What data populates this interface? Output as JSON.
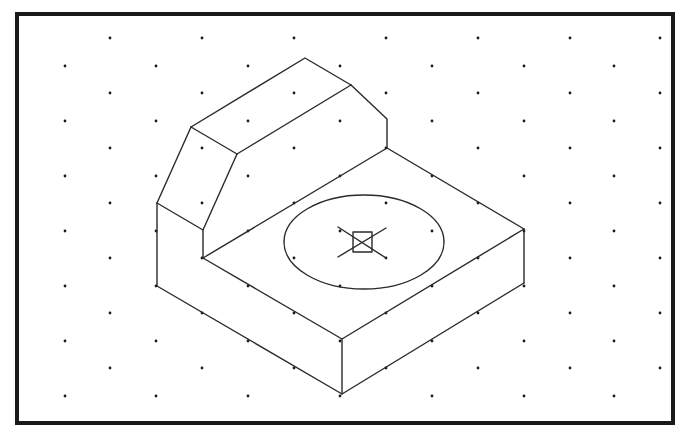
{
  "diagram": {
    "type": "isometric-drawing",
    "colors": {
      "background": "#ffffff",
      "line": "#2a2a2a",
      "frame": "#1a1a1a",
      "dot": "#1a1a1a"
    },
    "frame": {
      "x": 17,
      "y": 14,
      "width": 656,
      "height": 409
    },
    "grid": {
      "rows_y": [
        38,
        66,
        93,
        121,
        148,
        176,
        203,
        231,
        258,
        286,
        313,
        341,
        368,
        396
      ],
      "odd_row_x": [
        110,
        202,
        294,
        386,
        478,
        570,
        660
      ],
      "even_row_x": [
        65,
        156,
        248,
        340,
        432,
        524,
        614
      ],
      "dot_radius": 1.4
    },
    "edges": [
      {
        "name": "upright-top-ridge-back",
        "points": [
          [
            191,
            127
          ],
          [
            305,
            58
          ],
          [
            351,
            85
          ]
        ]
      },
      {
        "name": "upright-top-ridge-front",
        "points": [
          [
            237,
            154
          ],
          [
            351,
            85
          ]
        ]
      },
      {
        "name": "upright-top-left",
        "points": [
          [
            191,
            127
          ],
          [
            237,
            154
          ]
        ]
      },
      {
        "name": "chamfer-back-right",
        "points": [
          [
            351,
            85
          ],
          [
            387,
            119
          ],
          [
            387,
            148
          ]
        ]
      },
      {
        "name": "chamfer-front-left",
        "points": [
          [
            191,
            127
          ],
          [
            157,
            203
          ]
        ]
      },
      {
        "name": "chamfer-front-inner",
        "points": [
          [
            237,
            154
          ],
          [
            203,
            230
          ]
        ]
      },
      {
        "name": "upright-front-bottom-edge",
        "points": [
          [
            157,
            203
          ],
          [
            203,
            230
          ],
          [
            203,
            258
          ]
        ]
      },
      {
        "name": "left-vertical-edge",
        "points": [
          [
            157,
            203
          ],
          [
            157,
            286
          ]
        ]
      },
      {
        "name": "base-top-back-edge",
        "points": [
          [
            203,
            258
          ],
          [
            387,
            148
          ],
          [
            524,
            229
          ]
        ]
      },
      {
        "name": "base-top-front-edge",
        "points": [
          [
            203,
            258
          ],
          [
            342,
            339
          ],
          [
            524,
            229
          ]
        ]
      },
      {
        "name": "base-bottom-edge",
        "points": [
          [
            157,
            286
          ],
          [
            342,
            394
          ],
          [
            524,
            283
          ]
        ]
      },
      {
        "name": "front-vertical-edge",
        "points": [
          [
            342,
            339
          ],
          [
            342,
            394
          ]
        ]
      },
      {
        "name": "right-vertical-edge",
        "points": [
          [
            524,
            229
          ],
          [
            524,
            283
          ]
        ]
      }
    ],
    "hole": {
      "ellipse": {
        "cx": 364,
        "cy": 242,
        "rx": 80,
        "ry": 47
      },
      "center_box": {
        "x": 353,
        "y": 232,
        "width": 19,
        "height": 20
      },
      "center_lines": [
        {
          "x1": 338,
          "y1": 227,
          "x2": 386,
          "y2": 258
        },
        {
          "x1": 338,
          "y1": 257,
          "x2": 386,
          "y2": 228
        }
      ]
    }
  }
}
